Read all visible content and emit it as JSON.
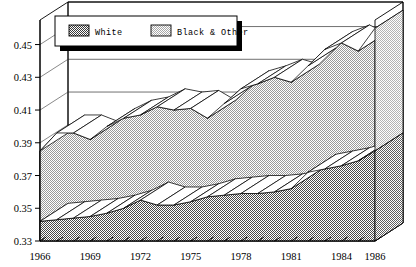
{
  "chart_data": {
    "type": "area",
    "stacked": true,
    "title": "",
    "subtitle": "",
    "xlabel": "",
    "ylabel": "",
    "grid": true,
    "legend_position": "top-left",
    "three_d": true,
    "x": [
      1966,
      1967,
      1968,
      1969,
      1970,
      1971,
      1972,
      1973,
      1974,
      1975,
      1976,
      1977,
      1978,
      1979,
      1980,
      1981,
      1982,
      1983,
      1984,
      1985,
      1986
    ],
    "xtick_labels": [
      "1966",
      "1969",
      "1972",
      "1975",
      "1978",
      "1981",
      "1984",
      "1986"
    ],
    "xtick_values": [
      1966,
      1969,
      1972,
      1975,
      1978,
      1981,
      1984,
      1986
    ],
    "ytick_labels": [
      "0.33",
      "0.35",
      "0.37",
      "0.39",
      "0.41",
      "0.43",
      "0.45"
    ],
    "ytick_values": [
      0.33,
      0.35,
      0.37,
      0.39,
      0.41,
      0.43,
      0.45
    ],
    "ylim": [
      0.33,
      0.465
    ],
    "xlim": [
      1966,
      1986
    ],
    "series": [
      {
        "name": "White",
        "fill": "#808080",
        "pattern": "dark-checker",
        "values": [
          0.342,
          0.343,
          0.344,
          0.345,
          0.347,
          0.35,
          0.355,
          0.352,
          0.352,
          0.354,
          0.357,
          0.358,
          0.359,
          0.359,
          0.36,
          0.362,
          0.372,
          0.374,
          0.376,
          0.379,
          0.385
        ]
      },
      {
        "name": "Black & Other",
        "fill": "#c8c8c8",
        "pattern": "light-checker",
        "cumulative_top": [
          0.385,
          0.396,
          0.396,
          0.392,
          0.4,
          0.405,
          0.407,
          0.412,
          0.41,
          0.411,
          0.405,
          0.414,
          0.423,
          0.426,
          0.43,
          0.427,
          0.437,
          0.447,
          0.451,
          0.446,
          0.46
        ],
        "values": [
          0.043,
          0.053,
          0.052,
          0.047,
          0.053,
          0.055,
          0.052,
          0.06,
          0.058,
          0.057,
          0.048,
          0.056,
          0.064,
          0.067,
          0.07,
          0.065,
          0.065,
          0.073,
          0.075,
          0.067,
          0.075
        ]
      }
    ]
  },
  "legend": {
    "items": [
      {
        "label": "White",
        "swatch": "dark-checker-swatch"
      },
      {
        "label": "Black & Other",
        "swatch": "light-checker-swatch"
      }
    ]
  },
  "colors": {
    "white_series": "#808080",
    "black_other_series": "#c8c8c8",
    "axis": "#000000",
    "grid": "#555555",
    "background": "#ffffff",
    "legend_shadow": "#000000"
  }
}
